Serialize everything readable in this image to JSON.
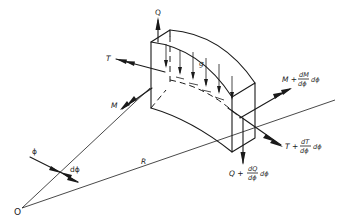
{
  "figure": {
    "labels": {
      "origin": "O",
      "radius": "R",
      "angle": "ϕ",
      "angle_increment": "dϕ",
      "load": "g",
      "shear_left": "Q",
      "torque_left": "T",
      "moment_left": "M",
      "moment_right": {
        "base": "M +",
        "num": "dM",
        "den": "dϕ",
        "tail": "dϕ"
      },
      "torque_right": {
        "base": "T +",
        "num": "dT",
        "den": "dϕ",
        "tail": "dϕ"
      },
      "shear_right": {
        "base": "Q +",
        "num": "dQ",
        "den": "dϕ",
        "tail": "dϕ"
      }
    },
    "colors": {
      "ink": "#1a1a1a",
      "background": "#ffffff"
    }
  }
}
